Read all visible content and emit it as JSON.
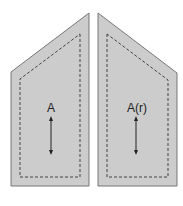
{
  "pieces": [
    {
      "name": "piece-a",
      "label": "A"
    },
    {
      "name": "piece-a-reversed",
      "label": "A(r)"
    }
  ],
  "colors": {
    "fill": "#cccccc",
    "outline": "#777777",
    "seam": "#444444",
    "arrow": "#222222"
  }
}
